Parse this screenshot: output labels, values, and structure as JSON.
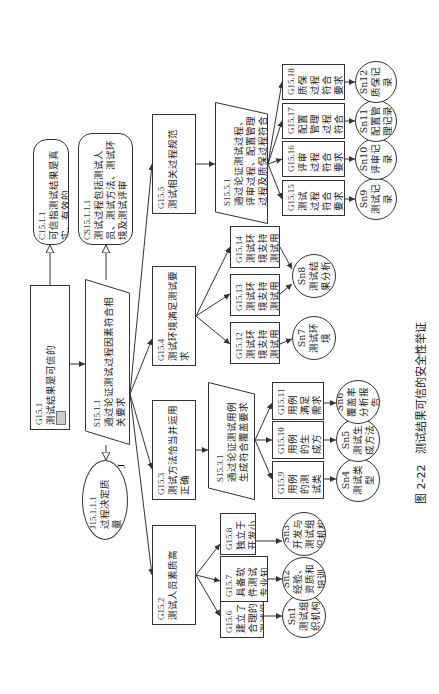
{
  "caption": {
    "label": "图 2-22",
    "title": "测试结果可信的安全性举证"
  },
  "nodes": {
    "G15_1": {
      "id": "G15.1",
      "text": "测试结果是可信的"
    },
    "C15_1_1": {
      "id": "C15.1.1",
      "text": "可信指测试结果是真实、有效的"
    },
    "CS15_1_1_1": {
      "id": "CS15.1.1.1",
      "text": "测试过程包括测试人员、测试方法、测试环境及测试评审"
    },
    "S15_1_1": {
      "id": "S15.1.1",
      "text": "通过论证测试过程因素符合相关要求"
    },
    "J15_1_1_1": {
      "id": "J15.1.1.1",
      "text": "过程决定质量",
      "mark": "J"
    },
    "G15_2": {
      "id": "G15.2",
      "text": "测试人员素质高"
    },
    "G15_3": {
      "id": "G15.3",
      "text": "测试方法恰当并运用正确"
    },
    "G15_4": {
      "id": "G15.4",
      "text": "测试环境满足测试要求"
    },
    "G15_5": {
      "id": "G15.5",
      "text": "测试相关过程规范"
    },
    "S15_3_1": {
      "id": "S15.3.1",
      "text": "通过论证测试用例生成符合覆盖要求"
    },
    "S15_5_1": {
      "id": "S15.5.1",
      "text": "通过论证测试过程、评审过程、配置管理过程及质保过程符合要求"
    },
    "G15_6": {
      "id": "G15.6",
      "text": "建立了合理的测试组织"
    },
    "G15_7": {
      "id": "G15.7",
      "text": "具备软件测试专业知识，符合岗位要求"
    },
    "G15_8": {
      "id": "G15.8",
      "text": "独立于开发小组"
    },
    "G15_9": {
      "id": "G15.9",
      "text": "用例的测试类型是充分的"
    },
    "G15_10": {
      "id": "G15.10",
      "text": "用例的生成方法是正确的"
    },
    "G15_11": {
      "id": "G15.11",
      "text": "用例满足需求覆盖率要求"
    },
    "G15_12": {
      "id": "G15.12",
      "text": "测试环境支持测试用例的施加"
    },
    "G15_13": {
      "id": "G15.13",
      "text": "测试环境支持测试用例的执行"
    },
    "G15_14": {
      "id": "G15.14",
      "text": "测试环境支持测试用例的输出收集"
    },
    "G15_15": {
      "id": "G15.15",
      "text": "测试过程符合要求"
    },
    "G15_16": {
      "id": "G15.16",
      "text": "评审过程符合要求"
    },
    "G15_17": {
      "id": "G15.17",
      "text": "配置管理过程符合要求"
    },
    "G15_18": {
      "id": "G15.18",
      "text": "质保过程符合要求"
    },
    "Sn1": {
      "id": "Sn1",
      "text": "测试组织机构"
    },
    "Sn2": {
      "id": "Sn2",
      "text": "经验、资质和培训"
    },
    "Sn3": {
      "id": "Sn3",
      "text": "开发与测试组织机构"
    },
    "Sn4": {
      "id": "Sn4",
      "text": "测试类型"
    },
    "Sn5": {
      "id": "Sn5",
      "text": "测试生成方法"
    },
    "Sn6": {
      "id": "Sn6",
      "text": "覆盖率分析报告"
    },
    "Sn7": {
      "id": "Sn7",
      "text": "测试环境"
    },
    "Sn8": {
      "id": "Sn8",
      "text": "测试结果分析"
    },
    "Sn9": {
      "id": "Sn9",
      "text": "测试记录"
    },
    "Sn10": {
      "id": "Sn10",
      "text": "评审记录"
    },
    "Sn11": {
      "id": "Sn11",
      "text": "配置管理记录"
    },
    "Sn12": {
      "id": "Sn12",
      "text": "质保记录"
    }
  },
  "colors": {
    "line": "#333333",
    "background": "#ffffff",
    "undeveloped_marker": "#cccccc"
  }
}
